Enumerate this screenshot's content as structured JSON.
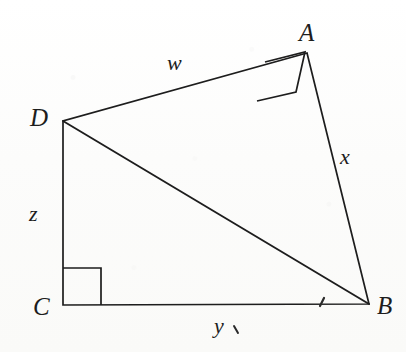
{
  "figure": {
    "background_color": "#fdfdfc",
    "stroke_color": "#1d1d1d",
    "vertices": [
      {
        "id": "A",
        "label": "A",
        "x": 307,
        "y": 53,
        "label_x": 299,
        "label_y": 20
      },
      {
        "id": "B",
        "label": "B",
        "x": 369,
        "y": 304,
        "label_x": 377,
        "label_y": 293
      },
      {
        "id": "C",
        "label": "C",
        "x": 63,
        "y": 305,
        "label_x": 33,
        "label_y": 294
      },
      {
        "id": "D",
        "label": "D",
        "x": 63,
        "y": 121,
        "label_x": 30,
        "label_y": 105
      }
    ],
    "segments": [
      {
        "id": "DA",
        "from": "D",
        "to": "A",
        "label": "w",
        "label_x": 167,
        "label_y": 52
      },
      {
        "id": "AB",
        "from": "A",
        "to": "B",
        "label": "x",
        "label_x": 340,
        "label_y": 146
      },
      {
        "id": "CB",
        "from": "C",
        "to": "B",
        "label": "y",
        "label_x": 214,
        "label_y": 315
      },
      {
        "id": "DC",
        "from": "D",
        "to": "C",
        "label": "z",
        "label_x": 29,
        "label_y": 203
      },
      {
        "id": "DB",
        "from": "D",
        "to": "B",
        "label": "",
        "label_x": 0,
        "label_y": 0
      }
    ],
    "right_angles": [
      {
        "id": "angle-at-A",
        "at": "A",
        "note": "right angle DAB",
        "points": "266,63 306,54 307,54 297,93 296,93 266,64"
      },
      {
        "id": "angle-at-C",
        "at": "C",
        "note": "right angle DCB",
        "points": "63,268 101,268 101,305"
      }
    ],
    "stray_marks": [
      {
        "id": "tick-on-CB",
        "glyph": "′",
        "x": 320,
        "y": 293,
        "rotate": -62
      },
      {
        "id": "comma-after-y",
        "glyph": "′",
        "x": 232,
        "y": 317,
        "rotate": 25
      }
    ]
  }
}
